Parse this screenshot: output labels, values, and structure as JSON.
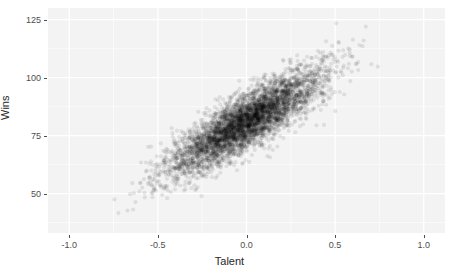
{
  "chart_data": {
    "type": "scatter",
    "title": "",
    "subtitle": "",
    "xlabel": "Talent",
    "ylabel": "Wins",
    "xlim": [
      -1.12,
      1.12
    ],
    "ylim": [
      33,
      130
    ],
    "xticks": [
      -1.0,
      -0.5,
      0.0,
      0.5,
      1.0
    ],
    "xtick_labels": [
      "-1.0",
      "-0.5",
      "0.0",
      "0.5",
      "1.0"
    ],
    "yticks": [
      50,
      75,
      100,
      125
    ],
    "ytick_labels": [
      "50",
      "75",
      "100",
      "125"
    ],
    "grid": true,
    "grid_major": true,
    "grid_minor": true,
    "legend": "none",
    "n_points": 4500,
    "point_color": "#000000",
    "point_alpha": 0.09,
    "point_radius": 2.1,
    "correlation": 0.85,
    "x_mean": 0.0,
    "x_sd": 0.215,
    "y_mean": 81.0,
    "y_sd": 11.2,
    "x_observed_range": [
      -0.95,
      0.92
    ],
    "y_observed_range": [
      39,
      125
    ],
    "series": [
      {
        "name": "teams",
        "summary_bins": {
          "note": "Representative density profile along the major axis of the point cloud.",
          "x_centers": [
            -0.85,
            -0.75,
            -0.65,
            -0.55,
            -0.45,
            -0.35,
            -0.25,
            -0.15,
            -0.05,
            0.05,
            0.15,
            0.25,
            0.35,
            0.45,
            0.55,
            0.65,
            0.75,
            0.85
          ],
          "y_means": [
            47,
            50,
            53,
            58,
            63,
            68,
            72,
            77,
            80,
            83,
            87,
            91,
            95,
            99,
            104,
            108,
            112,
            116
          ],
          "counts": [
            4,
            9,
            22,
            58,
            130,
            275,
            470,
            640,
            720,
            715,
            630,
            465,
            280,
            135,
            60,
            24,
            9,
            4
          ]
        }
      }
    ]
  },
  "axes": {
    "y": {
      "title": "Wins",
      "ticks": [
        {
          "label": "125",
          "value": 125
        },
        {
          "label": "100",
          "value": 100
        },
        {
          "label": "75",
          "value": 75
        },
        {
          "label": "50",
          "value": 50
        }
      ]
    },
    "x": {
      "title": "Talent",
      "ticks": [
        {
          "label": "-1.0",
          "value": -1.0
        },
        {
          "label": "-0.5",
          "value": -0.5
        },
        {
          "label": "0.0",
          "value": 0.0
        },
        {
          "label": "0.5",
          "value": 0.5
        },
        {
          "label": "1.0",
          "value": 1.0
        }
      ]
    }
  },
  "colors": {
    "panel_background": "#f3f3f3",
    "plot_background": "#ffffff",
    "grid_major": "#ffffff",
    "grid_minor": "#fafafa",
    "axis_text": "#4d4d4d",
    "axis_title": "#262626",
    "point": "#000000"
  }
}
